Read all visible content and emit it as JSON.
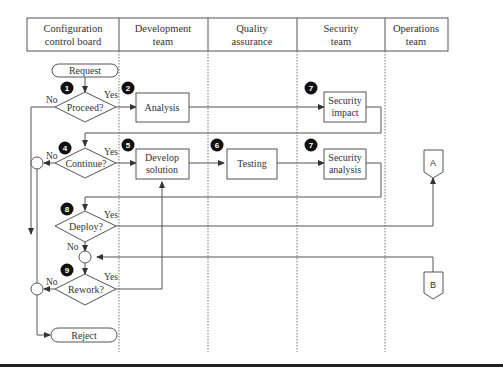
{
  "lanes": [
    {
      "line1": "Configuration",
      "line2": "control board"
    },
    {
      "line1": "Development",
      "line2": "team"
    },
    {
      "line1": "Quality",
      "line2": "assurance"
    },
    {
      "line1": "Security",
      "line2": "team"
    },
    {
      "line1": "Operations",
      "line2": "team"
    }
  ],
  "nodes": {
    "request": "Request",
    "proceed": "Proceed?",
    "analysis": "Analysis",
    "security_impact": {
      "line1": "Security",
      "line2": "impact"
    },
    "continue": "Continue?",
    "develop": {
      "line1": "Develop",
      "line2": "solution"
    },
    "testing": "Testing",
    "security_analysis": {
      "line1": "Security",
      "line2": "analysis"
    },
    "deploy": "Deploy?",
    "rework": "Rework?",
    "reject": "Reject",
    "connector_a": "A",
    "connector_b": "B"
  },
  "badges": {
    "b1": "1",
    "b2": "2",
    "b7a": "7",
    "b4": "4",
    "b5": "5",
    "b6": "6",
    "b7b": "7",
    "b8": "8",
    "b9": "9"
  },
  "labels": {
    "yes": "Yes",
    "no": "No"
  }
}
